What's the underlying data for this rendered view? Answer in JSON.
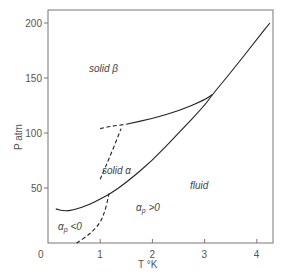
{
  "chart_data": {
    "type": "line",
    "title": "",
    "xlabel": "T °K",
    "ylabel": "P atm",
    "xlim": [
      0,
      4.3
    ],
    "ylim": [
      0,
      212
    ],
    "xticks": [
      0,
      1,
      2,
      3,
      4
    ],
    "yticks": [
      50,
      100,
      150,
      200
    ],
    "x_tick_labels": [
      "0",
      "1",
      "2",
      "3",
      "4"
    ],
    "y_tick_labels": [
      "0",
      "50",
      "100",
      "150",
      "200"
    ],
    "grid": false,
    "legend": null,
    "series": [
      {
        "name": "melting curve (solid α / fluid)",
        "style": "solid",
        "x": [
          0.15,
          0.3,
          0.5,
          0.8,
          1.0,
          1.2,
          1.5,
          2.0,
          2.5,
          3.0,
          3.15,
          3.5,
          4.0,
          4.25
        ],
        "y": [
          31,
          29,
          30,
          35,
          40,
          45,
          55,
          75,
          100,
          125,
          135,
          155,
          185,
          200
        ]
      },
      {
        "name": "solid α / solid β boundary",
        "style": "solid",
        "x": [
          1.5,
          2.0,
          2.5,
          3.0,
          3.15
        ],
        "y": [
          108,
          113,
          120,
          130,
          135
        ]
      },
      {
        "name": "solid α / solid β boundary (extrapolated)",
        "style": "dashed",
        "x": [
          1.0,
          1.2,
          1.5
        ],
        "y": [
          104,
          106,
          108
        ]
      },
      {
        "name": "α_p = 0 line (fluid)",
        "style": "dashed",
        "x": [
          0.55,
          0.8,
          1.0,
          1.1,
          1.17
        ],
        "y": [
          0,
          8,
          18,
          30,
          45
        ]
      },
      {
        "name": "α_p = 0 line (solid α)",
        "style": "dashed",
        "x": [
          1.0,
          1.2,
          1.4
        ],
        "y": [
          58,
          80,
          104
        ]
      }
    ],
    "annotations": [
      {
        "text": "solid β",
        "x": 0.75,
        "y": 150
      },
      {
        "text": "solid α",
        "x": 1.05,
        "y": 66
      },
      {
        "text": "fluid",
        "x": 2.3,
        "y": 42
      },
      {
        "text": "α_p > 0",
        "x": 1.35,
        "y": 22
      },
      {
        "text": "α_p < 0",
        "x": 0.15,
        "y": 12
      }
    ]
  },
  "labels": {
    "x_axis": "T °K",
    "y_axis": "P  atm",
    "solid_beta": "solid β",
    "solid_alpha": "solid α",
    "fluid": "fluid",
    "alpha_pos_a": "α",
    "alpha_pos_sub": "p",
    "alpha_pos_b": " >0",
    "alpha_neg_a": "α",
    "alpha_neg_sub": "p",
    "alpha_neg_b": " <0"
  }
}
